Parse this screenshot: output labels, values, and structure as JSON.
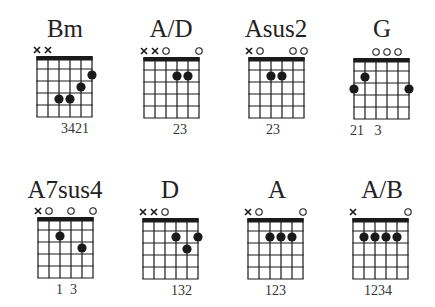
{
  "page": {
    "background": "#ffffff",
    "ink": "#1a1a1a"
  },
  "grid": {
    "strings": 6,
    "frets": 5,
    "cell_w": 11,
    "cell_h": 12
  },
  "chords": [
    {
      "name": "Bm",
      "box": [
        37,
        57
      ],
      "title_cx": 65,
      "title_top": 16,
      "markers": [
        "x",
        "x",
        "",
        "",
        "",
        ""
      ],
      "dots": [
        [
          2,
          4
        ],
        [
          3,
          4
        ],
        [
          4,
          3
        ],
        [
          5,
          2
        ]
      ],
      "fingering": "3421",
      "finger_x": 61
    },
    {
      "name": "A/D",
      "box": [
        144,
        58
      ],
      "title_cx": 171,
      "title_top": 16,
      "markers": [
        "x",
        "x",
        "o",
        "",
        "",
        "o"
      ],
      "dots": [
        [
          3,
          2
        ],
        [
          4,
          2
        ]
      ],
      "fingering": "23",
      "finger_x": 173
    },
    {
      "name": "Asus2",
      "box": [
        249,
        58
      ],
      "title_cx": 276,
      "title_top": 16,
      "markers": [
        "x",
        "o",
        "",
        "",
        "o",
        "o"
      ],
      "dots": [
        [
          2,
          2
        ],
        [
          3,
          2
        ]
      ],
      "fingering": "23",
      "finger_x": 266
    },
    {
      "name": "G",
      "box": [
        354,
        59
      ],
      "title_cx": 382,
      "title_top": 16,
      "markers": [
        "",
        "",
        "o",
        "o",
        "o",
        ""
      ],
      "dots": [
        [
          0,
          3
        ],
        [
          1,
          2
        ],
        [
          5,
          3
        ]
      ],
      "fingering": "21   3",
      "finger_x": 350
    },
    {
      "name": "A7sus4",
      "box": [
        38,
        218
      ],
      "title_cx": 65,
      "title_top": 177,
      "markers": [
        "x",
        "o",
        "",
        "o",
        "",
        "o"
      ],
      "dots": [
        [
          2,
          2
        ],
        [
          4,
          3
        ]
      ],
      "fingering": "1  3",
      "finger_x": 56
    },
    {
      "name": "D",
      "box": [
        143,
        219
      ],
      "title_cx": 170,
      "title_top": 177,
      "markers": [
        "x",
        "x",
        "o",
        "",
        "",
        ""
      ],
      "dots": [
        [
          3,
          2
        ],
        [
          4,
          3
        ],
        [
          5,
          2
        ]
      ],
      "fingering": "132",
      "finger_x": 171
    },
    {
      "name": "A",
      "box": [
        248,
        219
      ],
      "title_cx": 277,
      "title_top": 177,
      "markers": [
        "x",
        "o",
        "",
        "",
        "",
        "o"
      ],
      "dots": [
        [
          2,
          2
        ],
        [
          3,
          2
        ],
        [
          4,
          2
        ]
      ],
      "fingering": "123",
      "finger_x": 265
    },
    {
      "name": "A/B",
      "box": [
        353,
        219
      ],
      "title_cx": 382,
      "title_top": 177,
      "markers": [
        "x",
        "",
        "",
        "",
        "",
        "o"
      ],
      "dots": [
        [
          1,
          2
        ],
        [
          2,
          2
        ],
        [
          3,
          2
        ],
        [
          4,
          2
        ]
      ],
      "fingering": "1234",
      "finger_x": 364
    }
  ]
}
